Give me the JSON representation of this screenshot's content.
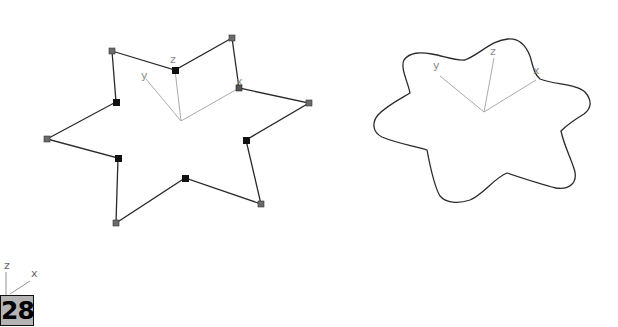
{
  "left_shape": {
    "type": "star-spline-corner",
    "vertices": [
      [
        112,
        51
      ],
      [
        175,
        70
      ],
      [
        232,
        38
      ],
      [
        239,
        88
      ],
      [
        309,
        103
      ],
      [
        246,
        140
      ],
      [
        261,
        204
      ],
      [
        185,
        178
      ],
      [
        116,
        223
      ],
      [
        118,
        158
      ],
      [
        47,
        139
      ],
      [
        116,
        102
      ]
    ],
    "vertex_kinds": [
      "outer",
      "inner",
      "outer",
      "inner",
      "outer",
      "inner",
      "outer",
      "inner",
      "outer",
      "inner",
      "outer",
      "inner"
    ],
    "axis": {
      "origin": [
        181,
        121
      ],
      "x_end": [
        239,
        88
      ],
      "y_end": [
        146,
        79
      ],
      "z_end": [
        175,
        70
      ],
      "labels": {
        "x": "x",
        "y": "y",
        "z": "z"
      }
    }
  },
  "right_shape": {
    "type": "star-spline-smooth",
    "axis": {
      "origin": [
        484,
        112
      ],
      "x_end": [
        536,
        80
      ],
      "y_end": [
        440,
        76
      ],
      "z_end": [
        494,
        58
      ],
      "labels": {
        "x": "x",
        "y": "y",
        "z": "z"
      }
    }
  },
  "gizmo": {
    "labels": {
      "x": "x",
      "y": "y",
      "z": "z"
    }
  },
  "badge": {
    "label": "28"
  },
  "colors": {
    "line": "#222222",
    "outer_vertex": "#6b6b6b",
    "inner_vertex": "#111111",
    "axis": "#9a9a9a",
    "badge_bg": "#b4b4b4"
  }
}
